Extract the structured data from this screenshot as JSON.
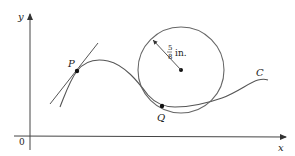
{
  "diagram": {
    "axes": {
      "x_label": "x",
      "y_label": "y",
      "origin_label": "0"
    },
    "curve": {
      "label": "C",
      "points": [
        {
          "name": "P",
          "label": "P",
          "role": "point with tangent line"
        },
        {
          "name": "Q",
          "label": "Q",
          "role": "point of tangency with osculating circle"
        }
      ]
    },
    "circle": {
      "radius_numerator": "5",
      "radius_denominator": "8",
      "radius_unit": "in."
    },
    "colors": {
      "curve": "#555555",
      "axis": "#444444",
      "point": "#111111"
    }
  }
}
